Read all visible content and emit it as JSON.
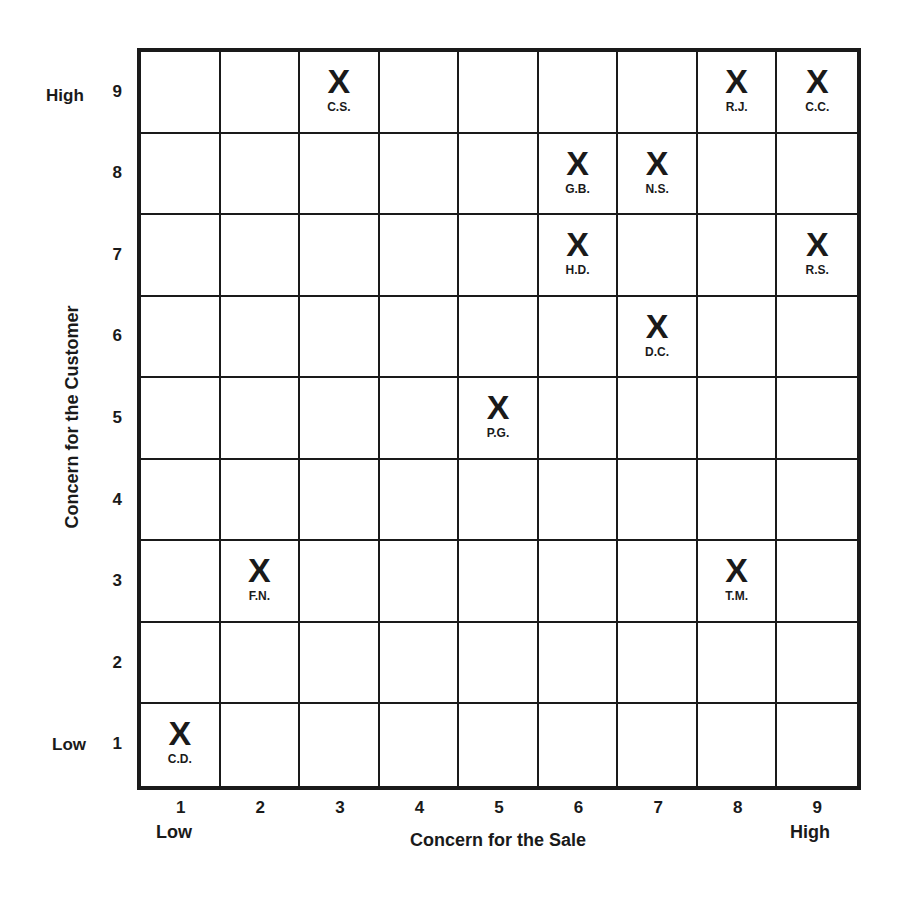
{
  "chart_data": {
    "type": "scatter",
    "title": "",
    "xlabel": "Concern for the Sale",
    "ylabel": "Concern for the Customer",
    "x_ticks": [
      "1",
      "2",
      "3",
      "4",
      "5",
      "6",
      "7",
      "8",
      "9"
    ],
    "y_ticks": [
      "1",
      "2",
      "3",
      "4",
      "5",
      "6",
      "7",
      "8",
      "9"
    ],
    "x_end_labels": {
      "low": "Low",
      "high": "High"
    },
    "y_end_labels": {
      "low": "Low",
      "high": "High"
    },
    "xlim": [
      1,
      9
    ],
    "ylim": [
      1,
      9
    ],
    "grid": true,
    "marker": "X",
    "points": [
      {
        "label": "C.S.",
        "x": 3,
        "y": 9
      },
      {
        "label": "R.J.",
        "x": 8,
        "y": 9
      },
      {
        "label": "C.C.",
        "x": 9,
        "y": 9
      },
      {
        "label": "G.B.",
        "x": 6,
        "y": 8
      },
      {
        "label": "N.S.",
        "x": 7,
        "y": 8
      },
      {
        "label": "H.D.",
        "x": 6,
        "y": 7
      },
      {
        "label": "R.S.",
        "x": 9,
        "y": 7
      },
      {
        "label": "D.C.",
        "x": 7,
        "y": 6
      },
      {
        "label": "P.G.",
        "x": 5,
        "y": 5
      },
      {
        "label": "F.N.",
        "x": 2,
        "y": 3
      },
      {
        "label": "T.M.",
        "x": 8,
        "y": 3
      },
      {
        "label": "C.D.",
        "x": 1,
        "y": 1
      }
    ]
  },
  "axes": {
    "xlabel": "Concern for the Sale",
    "ylabel": "Concern for the Customer",
    "low": "Low",
    "high": "High",
    "marker": "X"
  }
}
